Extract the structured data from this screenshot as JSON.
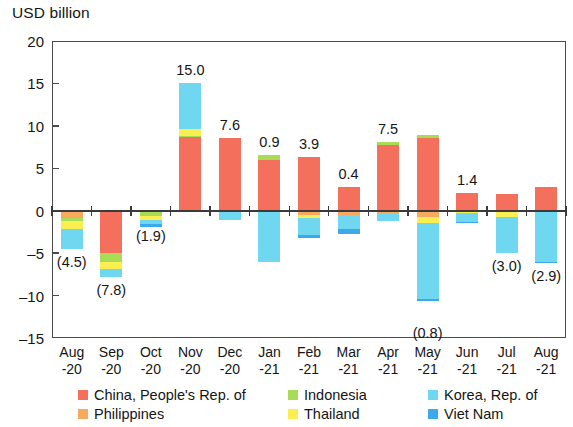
{
  "chart_data": {
    "type": "bar",
    "stacked": true,
    "title": "",
    "ylabel": "USD billion",
    "xlabel": "",
    "ylim": [
      -15,
      20
    ],
    "yticks": [
      20,
      15,
      10,
      5,
      0,
      -5,
      -10,
      -15
    ],
    "ytick_labels": [
      "20",
      "15",
      "10",
      "5",
      "0",
      "–5",
      "–10",
      "–15"
    ],
    "grid": false,
    "legend_position": "bottom",
    "categories": [
      "Aug\n-20",
      "Sep\n-20",
      "Oct\n-20",
      "Nov\n-20",
      "Dec\n-20",
      "Jan\n-21",
      "Feb\n-21",
      "Mar\n-21",
      "Apr\n-21",
      "May\n-21",
      "Jun\n-21",
      "Jul\n-21",
      "Aug\n-21"
    ],
    "category_lines": [
      [
        "Aug",
        "-20"
      ],
      [
        "Sep",
        "-20"
      ],
      [
        "Oct",
        "-20"
      ],
      [
        "Nov",
        "-20"
      ],
      [
        "Dec",
        "-20"
      ],
      [
        "Jan",
        "-21"
      ],
      [
        "Feb",
        "-21"
      ],
      [
        "Mar",
        "-21"
      ],
      [
        "Apr",
        "-21"
      ],
      [
        "May",
        "-21"
      ],
      [
        "Jun",
        "-21"
      ],
      [
        "Jul",
        "-21"
      ],
      [
        "Aug",
        "-21"
      ]
    ],
    "series": [
      {
        "name": "China, People's Rep. of",
        "color": "#F4705C",
        "values": [
          0,
          -5.0,
          0,
          8.7,
          8.6,
          6.0,
          6.3,
          2.8,
          7.8,
          8.6,
          2.1,
          2.0,
          2.8
        ]
      },
      {
        "name": "Philippines",
        "color": "#F9A95E",
        "values": [
          -0.9,
          0,
          0,
          0,
          0,
          0,
          -0.5,
          -0.5,
          -0.3,
          -0.7,
          0,
          0,
          0
        ]
      },
      {
        "name": "Indonesia",
        "color": "#A8DC56",
        "values": [
          -0.3,
          -1.0,
          -0.6,
          0.15,
          0,
          0.6,
          0,
          0,
          0.25,
          0.3,
          0,
          0,
          0
        ]
      },
      {
        "name": "Thailand",
        "color": "#FAEE50",
        "values": [
          -0.9,
          -0.9,
          -0.5,
          0.8,
          0,
          0,
          -0.4,
          0,
          0,
          -0.7,
          -0.3,
          -0.7,
          0
        ]
      },
      {
        "name": "Korea, Rep. of",
        "color": "#6FD8F0",
        "values": [
          -2.4,
          -0.9,
          -0.5,
          5.4,
          -1.1,
          -6.0,
          -2.0,
          -1.6,
          -0.9,
          -9.0,
          -1.0,
          -4.3,
          -6.0
        ]
      },
      {
        "name": "Viet Nam",
        "color": "#3BA9EA",
        "values": [
          0,
          0,
          -0.3,
          0,
          0,
          0,
          -0.3,
          -0.7,
          0,
          -0.3,
          -0.1,
          0,
          -0.2
        ]
      }
    ],
    "totals": [
      -4.5,
      -7.8,
      -1.9,
      15.0,
      7.6,
      0.9,
      3.9,
      0.4,
      7.5,
      -0.8,
      1.4,
      -3.0,
      -2.9
    ],
    "total_labels": [
      "(4.5)",
      "(7.8)",
      "(1.9)",
      "15.0",
      "7.6",
      "0.9",
      "3.9",
      "0.4",
      "7.5",
      "(0.8)",
      "1.4",
      "(3.0)",
      "(2.9)"
    ],
    "label_is_negative": [
      true,
      true,
      true,
      false,
      false,
      false,
      false,
      false,
      false,
      true,
      false,
      true,
      true
    ]
  },
  "legend": {
    "entries": [
      {
        "label": "China, People's Rep. of",
        "color": "#F4705C"
      },
      {
        "label": "Philippines",
        "color": "#F9A95E"
      },
      {
        "label": "Indonesia",
        "color": "#A8DC56"
      },
      {
        "label": "Thailand",
        "color": "#FAEE50"
      },
      {
        "label": "Korea, Rep. of",
        "color": "#6FD8F0"
      },
      {
        "label": "Viet Nam",
        "color": "#3BA9EA"
      }
    ]
  }
}
